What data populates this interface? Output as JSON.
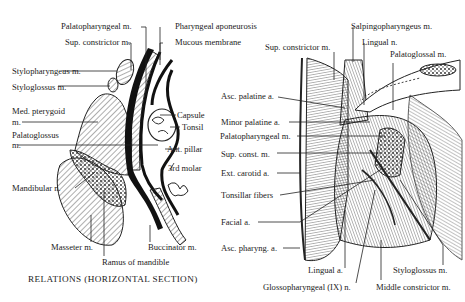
{
  "left_diagram": {
    "caption": "RELATIONS (HORIZONTAL SECTION)",
    "labels": {
      "palatopharyngeal": "Palatopharyngeal m.",
      "pharyngeal_aponeurosis": "Pharyngeal aponeurosis",
      "sup_constrictor": "Sup. constrictor m.",
      "mucous_membrane": "Mucous membrane",
      "stylopharyngeus": "Stylopharyngeus m.",
      "styloglossus": "Styloglossus m.",
      "med_pterygoid_1": "Med. pterygoid",
      "med_pterygoid_2": "m.",
      "palatoglossus_1": "Palatoglossus",
      "palatoglossus_2": "m.",
      "capsule": "Capsule",
      "tonsil": "Tonsil",
      "ant_pillar": "Ant. pillar",
      "third_molar": "3rd molar",
      "mandibular_n": "Mandibular n.",
      "masseter": "Masseter m.",
      "buccinator": "Buccinator m.",
      "ramus": "Ramus of mandible"
    }
  },
  "right_diagram": {
    "labels": {
      "salpingopharyngeus": "Salpingopharyngeus m.",
      "lingual_n": "Lingual n.",
      "sup_constrictor": "Sup. constrictor m.",
      "palatoglossal": "Palatoglossal m.",
      "asc_palatine": "Asc. palatine a.",
      "minor_palatine": "Minor palatine a.",
      "palatopharyngeal": "Palatopharyngeal m.",
      "sup_const": "Sup. const. m.",
      "ext_carotid": "Ext. carotid a.",
      "tonsillar_fibers": "Tonsillar fibers",
      "facial_a": "Facial a.",
      "asc_pharyng": "Asc. pharyng. a.",
      "lingual_a": "Lingual a.",
      "glossopharyngeal": "Glossopharyngeal (IX) n.",
      "styloglossus": "Styloglossus m.",
      "middle_constrictor": "Middle constrictor m."
    }
  }
}
